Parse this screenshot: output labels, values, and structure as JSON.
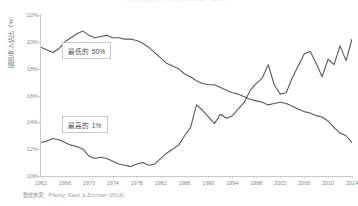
{
  "chart_data": {
    "type": "line",
    "title": "美國國民所得分配 1962－2014",
    "xlabel": "",
    "ylabel": "國民收入佔比（%）",
    "xlim": [
      1962,
      2014
    ],
    "ylim": [
      10,
      22
    ],
    "grid": false,
    "legend_position": "inline-annotation",
    "ytick_labels": [
      "22%",
      "20%",
      "18%",
      "16%",
      "14%",
      "12%",
      "10%"
    ],
    "ytick_values": [
      22,
      20,
      18,
      16,
      14,
      12,
      10
    ],
    "xtick_labels": [
      "1962",
      "1966",
      "1970",
      "1974",
      "1978",
      "1982",
      "1986",
      "1990",
      "1994",
      "1998",
      "2002",
      "2006",
      "2010",
      "2014"
    ],
    "xtick_values": [
      1962,
      1966,
      1970,
      1974,
      1978,
      1982,
      1986,
      1990,
      1994,
      1998,
      2002,
      2006,
      2010,
      2014
    ],
    "x": [
      1962,
      1963,
      1964,
      1965,
      1966,
      1967,
      1968,
      1969,
      1970,
      1971,
      1972,
      1973,
      1974,
      1975,
      1976,
      1977,
      1978,
      1979,
      1980,
      1981,
      1982,
      1983,
      1984,
      1985,
      1986,
      1987,
      1988,
      1989,
      1990,
      1991,
      1992,
      1993,
      1994,
      1995,
      1996,
      1997,
      1998,
      1999,
      2000,
      2001,
      2002,
      2003,
      2004,
      2005,
      2006,
      2007,
      2008,
      2009,
      2010,
      2011,
      2012,
      2013,
      2014
    ],
    "series": [
      {
        "name": "最低的 50%",
        "annotation": "最低的 50%",
        "color": "#585858",
        "values": [
          19.6,
          19.4,
          19.2,
          19.5,
          20.0,
          20.3,
          20.6,
          20.8,
          20.5,
          20.3,
          20.4,
          20.5,
          20.3,
          20.3,
          20.2,
          20.2,
          20.1,
          19.9,
          19.6,
          19.2,
          18.8,
          18.4,
          18.2,
          18.0,
          17.6,
          17.4,
          17.1,
          16.9,
          16.8,
          16.8,
          16.6,
          16.4,
          16.2,
          16.1,
          15.9,
          15.7,
          15.6,
          15.5,
          15.3,
          15.4,
          15.5,
          15.4,
          15.2,
          15.0,
          14.8,
          14.7,
          14.5,
          14.4,
          14.1,
          13.6,
          13.2,
          13.0,
          12.5
        ],
        "end_value": 12.5,
        "start_value": 19.6
      },
      {
        "name": "最高的 1%",
        "annotation": "最高的 1%",
        "color": "#585858",
        "values": [
          12.5,
          12.6,
          12.8,
          12.7,
          12.5,
          12.3,
          12.2,
          12.0,
          11.5,
          11.3,
          11.4,
          11.3,
          11.1,
          10.9,
          10.8,
          10.7,
          10.9,
          11.0,
          10.8,
          10.9,
          11.3,
          11.7,
          12.0,
          12.3,
          13.0,
          13.6,
          15.3,
          14.9,
          14.4,
          13.9,
          14.6,
          14.3,
          14.5,
          15.0,
          15.5,
          16.4,
          16.9,
          17.3,
          18.3,
          16.8,
          16.1,
          16.2,
          17.3,
          18.2,
          19.1,
          19.3,
          18.4,
          17.4,
          18.7,
          18.3,
          19.7,
          18.6,
          20.2
        ],
        "end_value": 20.2,
        "start_value": 12.5
      }
    ],
    "source_note": "數據來源：Piketty, Saez & Zucman (2016)"
  },
  "axis": {
    "y_title": "國民收入佔比（%）"
  },
  "footer": {
    "source": "數據來源：Piketty, Saez & Zucman (2016)"
  }
}
